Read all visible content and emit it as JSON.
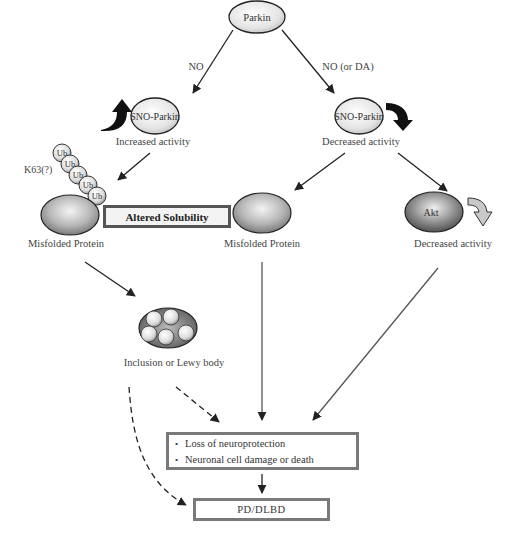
{
  "diagram": {
    "nodes": {
      "parkin": {
        "label": "Parkin"
      },
      "sno_parkin_left": {
        "label": "SNO-Parkin",
        "caption": "Increased activity"
      },
      "sno_parkin_right": {
        "label": "SNO-Parkin",
        "caption": "Decreased activity"
      },
      "misfolded_left": {
        "caption": "Misfolded Protein"
      },
      "misfolded_middle": {
        "caption": "Misfolded Protein"
      },
      "akt": {
        "label": "Akt",
        "caption": "Decreased activity"
      },
      "inclusion": {
        "caption": "Inclusion or Lewy body"
      },
      "ubiquitin_chain": {
        "labels": [
          "Ub",
          "Ub",
          "Ub",
          "Ub",
          "Ub"
        ],
        "linkage_label": "K63(?)"
      }
    },
    "edge_labels": {
      "left": "NO",
      "right": "NO (or DA)"
    },
    "boxes": {
      "altered_solubility": "Altered Solubility",
      "outcome": {
        "items": [
          "Loss of neuroprotection",
          "Neuronal cell damage or death"
        ]
      },
      "disease": "PD/DLBD"
    },
    "colors": {
      "box_border": "#7a7a7a",
      "arrow": "#222222",
      "node_fill_light": "#f2f2f2",
      "node_fill_dark": "#8a8a8a"
    }
  }
}
